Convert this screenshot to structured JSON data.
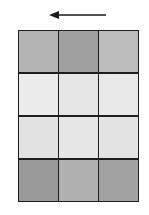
{
  "diagram": {
    "arrow": {
      "direction": "left",
      "color": "#1a1a1a"
    },
    "grid": {
      "rows": 4,
      "cols": 3,
      "border_color": "#1e1e1e",
      "cells": [
        [
          "#b4b4b4",
          "#a0a0a0",
          "#bcbcbc"
        ],
        [
          "#ececec",
          "#e6e6e6",
          "#e9e9e9"
        ],
        [
          "#e2e2e2",
          "#e6e6e6",
          "#e3e3e3"
        ],
        [
          "#9a9a9a",
          "#b0b0b0",
          "#a2a2a2"
        ]
      ]
    }
  }
}
